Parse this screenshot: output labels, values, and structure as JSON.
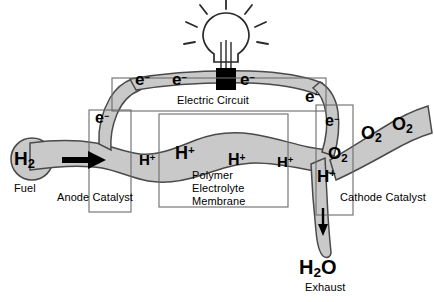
{
  "diagram": {
    "type": "schematic",
    "colors": {
      "channel_fill": "#c9c9c9",
      "channel_stroke": "#4a4a4a",
      "box_stroke": "#6b6b6b",
      "text": "#000000",
      "load_block": "#000000",
      "background": "#ffffff"
    },
    "boxes": [
      {
        "id": "anode",
        "label": "Anode Catalyst"
      },
      {
        "id": "membrane",
        "label_line1": "Polymer",
        "label_line2": "Electrolyte",
        "label_line3": "Membrane"
      },
      {
        "id": "circuit",
        "label": "Electric Circuit"
      },
      {
        "id": "cathode",
        "label": "Cathode Catalyst"
      }
    ],
    "inlet": {
      "species": "H",
      "subscript": "2",
      "caption": "Fuel",
      "flow_arrow": "right-arrow"
    },
    "outlet": {
      "species": "H",
      "subscript": "2",
      "species_tail": "O",
      "caption": "Exhaust",
      "flow_arrow": "down-arrow"
    },
    "oxidant": {
      "species": "O",
      "subscript": "2",
      "count": 3
    },
    "electrons": {
      "symbol": "e",
      "charge": "−",
      "count": 6
    },
    "protons": {
      "symbol": "H",
      "charge": "+",
      "count": 5
    },
    "lamp": {
      "name": "light-bulb",
      "rays": 7,
      "load_label": ""
    },
    "labels": {
      "electric_circuit": "Electric Circuit",
      "anode_catalyst": "Anode Catalyst",
      "cathode_catalyst": "Cathode Catalyst",
      "polymer": "Polymer",
      "electrolyte": "Electrolyte",
      "membrane": "Membrane",
      "fuel": "Fuel",
      "exhaust": "Exhaust",
      "h2": "H",
      "h2_sub": "2",
      "h2o": "H",
      "h2o_sub": "2",
      "h2o_tail": "O",
      "o2": "O",
      "o2_sub": "2",
      "e_sym": "e",
      "e_sup": "−",
      "h_sym": "H",
      "h_sup": "+"
    }
  }
}
